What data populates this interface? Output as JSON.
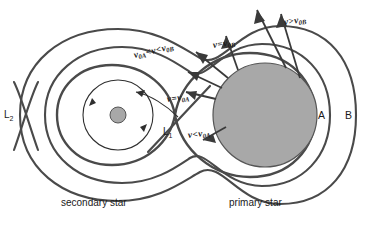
{
  "figure": {
    "colors": {
      "curve": "#4a4a4a",
      "star_fill": "#a8a8a8",
      "star_stroke": "#555555",
      "arrow": "#3a3a3a",
      "text": "#1a1a1a",
      "background": "#ffffff"
    }
  },
  "velocity_labels": {
    "between_a_and_b": {
      "var": "v",
      "sub1": "0A",
      "op1": "<",
      "mid": "v",
      "op2": "<",
      "var2": "v",
      "sub2": "0B"
    },
    "equal_b": {
      "var": "v",
      "op": "=",
      "var2": "v",
      "sub": "0B"
    },
    "greater_b": {
      "var": "v",
      "op": ">",
      "var2": "v",
      "sub": "0B"
    },
    "equal_a": {
      "var": "v",
      "op": "=",
      "var2": "v",
      "sub": "0A"
    },
    "less_a": {
      "var": "v",
      "op": "<",
      "var2": "v",
      "sub": "0A"
    }
  },
  "lagrange_points": {
    "l1": {
      "label": "L",
      "sub": "1"
    },
    "l2": {
      "label": "L",
      "sub": "2"
    }
  },
  "regions": {
    "a": "A",
    "b": "B"
  },
  "captions": {
    "secondary": "secondary star",
    "primary": "primary star"
  }
}
